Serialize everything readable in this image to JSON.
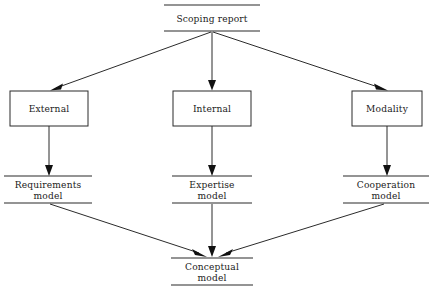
{
  "diagram": {
    "type": "flowchart",
    "background_color": "#ffffff",
    "line_color": "#2b2b2b",
    "text_color": "#1a1a1a",
    "nodes": [
      {
        "id": "scoping-report",
        "label": "Scoping report",
        "shape": "open-bar",
        "lines": [
          "Scoping report"
        ],
        "x": 212,
        "y": 18,
        "width": 96,
        "top_line_y": 5,
        "bottom_line_y": 31
      },
      {
        "id": "external",
        "label": "External",
        "shape": "rectangle",
        "lines": [
          "External"
        ],
        "x": 49,
        "y": 108,
        "rect_x": 10,
        "rect_y": 91,
        "rect_w": 78,
        "rect_h": 35
      },
      {
        "id": "internal",
        "label": "Internal",
        "shape": "rectangle",
        "lines": [
          "Internal"
        ],
        "x": 212,
        "y": 108,
        "rect_x": 173,
        "rect_y": 91,
        "rect_w": 78,
        "rect_h": 35
      },
      {
        "id": "modality",
        "label": "Modality",
        "shape": "rectangle",
        "lines": [
          "Modality"
        ],
        "x": 387,
        "y": 108,
        "rect_x": 352,
        "rect_y": 91,
        "rect_w": 70,
        "rect_h": 35
      },
      {
        "id": "requirements-model",
        "label": "Requirements model",
        "shape": "open-bar",
        "lines": [
          "Requirements",
          "model"
        ],
        "x": 48,
        "y": 189,
        "width": 88,
        "top_line_y": 176,
        "bottom_line_y": 203
      },
      {
        "id": "expertise-model",
        "label": "Expertise model",
        "shape": "open-bar",
        "lines": [
          "Expertise",
          "model"
        ],
        "x": 212,
        "y": 189,
        "width": 80,
        "top_line_y": 176,
        "bottom_line_y": 203
      },
      {
        "id": "cooperation-model",
        "label": "Cooperation model",
        "shape": "open-bar",
        "lines": [
          "Cooperation",
          "model"
        ],
        "x": 386,
        "y": 189,
        "width": 86,
        "top_line_y": 176,
        "bottom_line_y": 203
      },
      {
        "id": "conceptual-model",
        "label": "Conceptual model",
        "shape": "open-bar",
        "lines": [
          "Conceptual",
          "model"
        ],
        "x": 212,
        "y": 271,
        "width": 82,
        "top_line_y": 258,
        "bottom_line_y": 285
      }
    ],
    "edges": [
      {
        "id": "scoping-to-external",
        "from": "scoping-report",
        "to": "external",
        "kind": "diagonal-left"
      },
      {
        "id": "scoping-to-internal",
        "from": "scoping-report",
        "to": "internal",
        "kind": "vertical"
      },
      {
        "id": "scoping-to-modality",
        "from": "scoping-report",
        "to": "modality",
        "kind": "diagonal-right"
      },
      {
        "id": "external-to-requirements",
        "from": "external",
        "to": "requirements-model",
        "kind": "vertical"
      },
      {
        "id": "internal-to-expertise",
        "from": "internal",
        "to": "expertise-model",
        "kind": "vertical"
      },
      {
        "id": "modality-to-cooperation",
        "from": "modality",
        "to": "cooperation-model",
        "kind": "vertical"
      },
      {
        "id": "requirements-to-conceptual",
        "from": "requirements-model",
        "to": "conceptual-model",
        "kind": "diagonal-right"
      },
      {
        "id": "expertise-to-conceptual",
        "from": "expertise-model",
        "to": "conceptual-model",
        "kind": "vertical"
      },
      {
        "id": "cooperation-to-conceptual",
        "from": "cooperation-model",
        "to": "conceptual-model",
        "kind": "diagonal-left"
      }
    ]
  }
}
